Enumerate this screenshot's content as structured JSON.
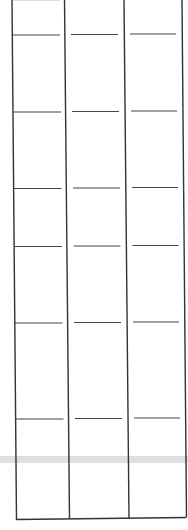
{
  "figure": {
    "stroke_color": "#333333",
    "band_color": "#d8d8d8",
    "columns": [
      {
        "x_top": 12,
        "x_bottom": 16
      },
      {
        "x_top": 64,
        "x_bottom": 69
      },
      {
        "x_top": 124,
        "x_bottom": 129
      },
      {
        "x_top": 182,
        "x_bottom": 186
      }
    ],
    "rows_y": [
      35,
      112,
      188,
      246,
      323,
      419
    ],
    "bottom_y": 519,
    "band_y": 460
  }
}
